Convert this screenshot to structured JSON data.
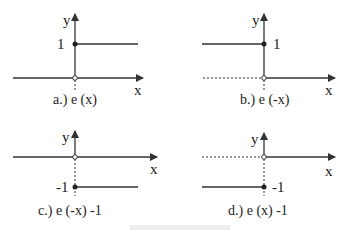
{
  "panels": [
    {
      "id": "a",
      "caption": "a.) e (x)",
      "y_label": "y",
      "x_label": "x",
      "level_label": "1"
    },
    {
      "id": "b",
      "caption": "b.) e (-x)",
      "y_label": "y",
      "x_label": "x",
      "level_label": "1"
    },
    {
      "id": "c",
      "caption": "c.) e (-x) -1",
      "y_label": "y",
      "x_label": "x",
      "level_label": "-1"
    },
    {
      "id": "d",
      "caption": "d.) e (x) -1",
      "y_label": "y",
      "x_label": "x",
      "level_label": "-1"
    }
  ],
  "colors": {
    "line": "#333333",
    "text": "#222222"
  }
}
